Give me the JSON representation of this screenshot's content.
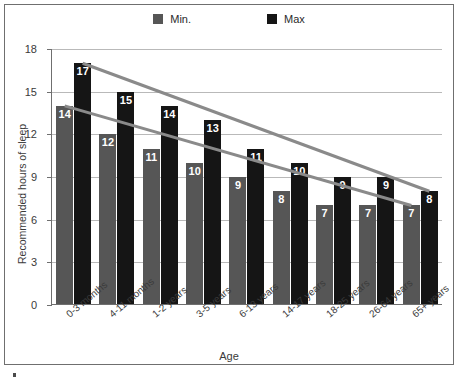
{
  "legend": {
    "position": "top-center",
    "entries": [
      {
        "label": "Min.",
        "color": "#565656",
        "swatch_name": "legend-swatch-min"
      },
      {
        "label": "Max",
        "color": "#151515",
        "swatch_name": "legend-swatch-max"
      }
    ]
  },
  "chart_data": {
    "type": "bar",
    "title": "",
    "subtitle": "",
    "xlabel": "Age",
    "ylabel": "Recommended hours of sleep",
    "ylim": [
      0,
      18
    ],
    "yticks": [
      0,
      3,
      6,
      9,
      12,
      15,
      18
    ],
    "ytick_labels": [
      "0",
      "3",
      "6",
      "9",
      "12",
      "15",
      "18"
    ],
    "grid": true,
    "grid_axis": "y",
    "legend_position": "top-center",
    "categories": [
      "0-3 months",
      "4-11 months",
      "1-2 years",
      "3-5 years",
      "6-13 years",
      "14-17 years",
      "18-25 years",
      "26-64 years",
      "65+ years"
    ],
    "series": [
      {
        "name": "Min.",
        "color": "#565656",
        "values": [
          14,
          12,
          11,
          10,
          9,
          8,
          7,
          7,
          7
        ]
      },
      {
        "name": "Max",
        "color": "#151515",
        "values": [
          17,
          15,
          14,
          13,
          11,
          10,
          9,
          9,
          8
        ]
      }
    ],
    "annotations": [
      {
        "type": "trendline",
        "series": "Max",
        "color": "#8a8a8a",
        "from_value": 17,
        "to_value": 8
      },
      {
        "type": "trendline",
        "series": "Min.",
        "color": "#8a8a8a",
        "from_value": 14,
        "to_value": 7
      }
    ]
  }
}
